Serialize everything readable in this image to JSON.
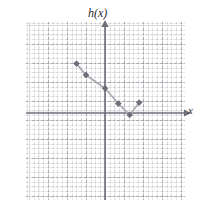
{
  "figure": {
    "y_axis_label": "h(x)",
    "x_axis_label": "x",
    "colors": {
      "axis": "#6e6e78",
      "grid_major": "#7878847f",
      "grid_minor": "#96969a4d",
      "point": "#70707c",
      "line": "#a8a8b0",
      "background": "#ffffff"
    }
  },
  "chart_data": {
    "type": "scatter",
    "title": "",
    "subtitle": "",
    "xlabel": "x",
    "ylabel": "h(x)",
    "xlim": [
      -4.2,
      4.2
    ],
    "ylim": [
      -4.8,
      4.6
    ],
    "grid": true,
    "legend": null,
    "major_tick_step": 1,
    "minor_subdivisions": 4,
    "annotations": [],
    "series": [
      {
        "name": "h(x)",
        "marker": "diamond",
        "connected": true,
        "x": [
          -1.5,
          -1.0,
          0.0,
          0.7,
          1.3,
          1.8
        ],
        "y": [
          2.6,
          2.0,
          1.3,
          0.5,
          -0.1,
          0.55
        ],
        "points": [
          {
            "x": -1.5,
            "y": 2.6
          },
          {
            "x": -1.0,
            "y": 2.0
          },
          {
            "x": 0.0,
            "y": 1.3
          },
          {
            "x": 0.7,
            "y": 0.5
          },
          {
            "x": 1.3,
            "y": -0.1
          },
          {
            "x": 1.8,
            "y": 0.55
          }
        ]
      }
    ]
  }
}
